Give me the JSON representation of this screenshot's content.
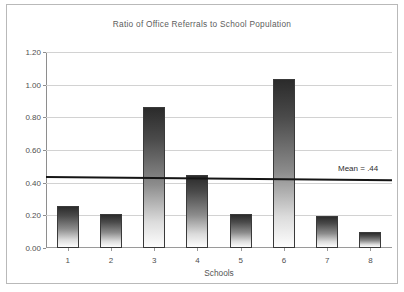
{
  "chart_data": {
    "type": "bar",
    "title": "Ratio of Office Referrals to School Population",
    "xlabel": "Schools",
    "ylabel": "",
    "categories": [
      "1",
      "2",
      "3",
      "4",
      "5",
      "6",
      "7",
      "8"
    ],
    "values": [
      0.255,
      0.21,
      0.865,
      0.445,
      0.21,
      1.035,
      0.195,
      0.1
    ],
    "ylim": [
      0.0,
      1.2
    ],
    "ytick_labels": [
      "0.00",
      "0.20",
      "0.40",
      "0.60",
      "0.80",
      "1.00",
      "1.20"
    ],
    "ytick_values": [
      0.0,
      0.2,
      0.4,
      0.6,
      0.8,
      1.0,
      1.2
    ],
    "grid": true,
    "legend": "none",
    "annotations": [
      {
        "name": "mean-reference-line",
        "label": "Mean = .44",
        "value": 0.44,
        "orientation": "horizontal",
        "color": "#151515"
      }
    ],
    "bar_style": {
      "fill": "vertical gradient dark-to-white",
      "top_color": "#2b2b2b",
      "bottom_color": "#fdfdfd",
      "outline_color": "#3a3a3a"
    }
  },
  "frame": {
    "border_color": "#b9b9b9"
  }
}
